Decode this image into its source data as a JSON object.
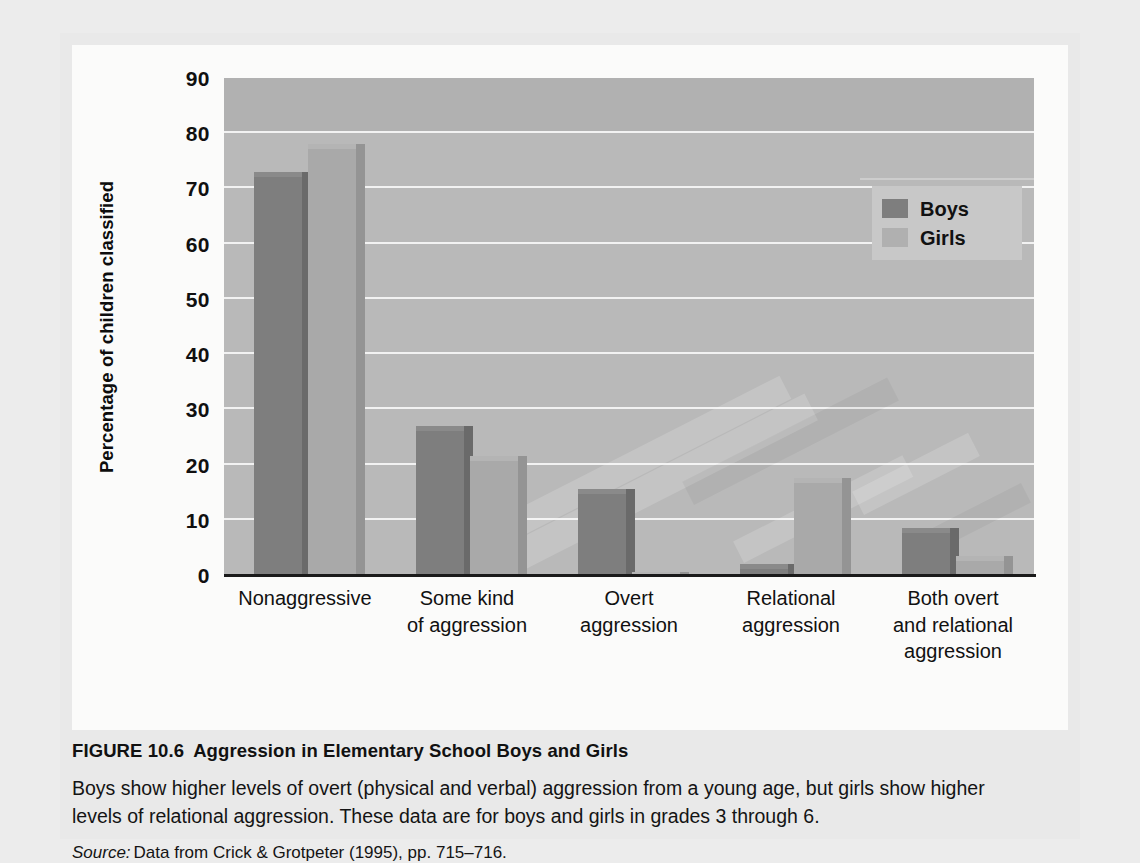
{
  "figure": {
    "label": "FIGURE 10.6",
    "title": "Aggression in Elementary School Boys and Girls",
    "description": "Boys show higher levels of overt (physical and verbal) aggression from a young age, but girls show higher levels of relational aggression. These data are for boys and girls in grades 3 through 6.",
    "source_label": "Source:",
    "source_text": "Data from Crick & Grotpeter (1995), pp. 715–716."
  },
  "chart_data": {
    "type": "bar",
    "title": "",
    "xlabel": "",
    "ylabel": "Percentage of children classified",
    "ylim": [
      0,
      90
    ],
    "yticks": [
      0,
      10,
      20,
      30,
      40,
      50,
      60,
      70,
      80,
      90
    ],
    "ytick_labels": [
      "0",
      "10",
      "20",
      "30",
      "40",
      "50",
      "60",
      "70",
      "80",
      "90"
    ],
    "grid": true,
    "legend_position": "top-right",
    "categories": [
      "Nonaggressive",
      "Some kind\nof aggression",
      "Overt\naggression",
      "Relational\naggression",
      "Both overt\nand relational\naggression"
    ],
    "category_lines": [
      [
        "Nonaggressive"
      ],
      [
        "Some kind",
        "of aggression"
      ],
      [
        "Overt",
        "aggression"
      ],
      [
        "Relational",
        "aggression"
      ],
      [
        "Both overt",
        "and relational",
        "aggression"
      ]
    ],
    "series": [
      {
        "name": "Boys",
        "color": "#7e7e7e",
        "values": [
          73,
          27,
          15.5,
          2,
          8.5
        ]
      },
      {
        "name": "Girls",
        "color": "#a9a9a9",
        "values": [
          78,
          21.5,
          0.5,
          17.5,
          3.5
        ]
      }
    ],
    "colors": {
      "plot_background": "#b9b9b9",
      "gridline": "#f2f2f2",
      "axis": "#1a1a1a",
      "panel_background": "#fbfbfa",
      "page_background": "#ececec"
    }
  },
  "legend": {
    "items": [
      {
        "label": "Boys",
        "swatch": "#7e7e7e"
      },
      {
        "label": "Girls",
        "swatch": "#b0b0b0"
      }
    ]
  }
}
